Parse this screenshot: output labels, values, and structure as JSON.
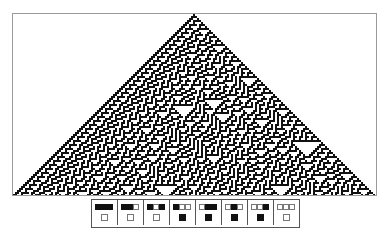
{
  "diagram": {
    "title": "",
    "rule_number": 30,
    "generations": 92,
    "cell_size_px": 2,
    "colors": {
      "on": "#111111",
      "off": "#ffffff",
      "frame": "#9a9a9a"
    },
    "initial_condition": "single black cell at center"
  },
  "rule_icons": [
    {
      "pattern": [
        1,
        1,
        1
      ],
      "output": 0
    },
    {
      "pattern": [
        1,
        1,
        0
      ],
      "output": 0
    },
    {
      "pattern": [
        1,
        0,
        1
      ],
      "output": 0
    },
    {
      "pattern": [
        1,
        0,
        0
      ],
      "output": 1
    },
    {
      "pattern": [
        0,
        1,
        1
      ],
      "output": 1
    },
    {
      "pattern": [
        0,
        1,
        0
      ],
      "output": 1
    },
    {
      "pattern": [
        0,
        0,
        1
      ],
      "output": 1
    },
    {
      "pattern": [
        0,
        0,
        0
      ],
      "output": 0
    }
  ]
}
